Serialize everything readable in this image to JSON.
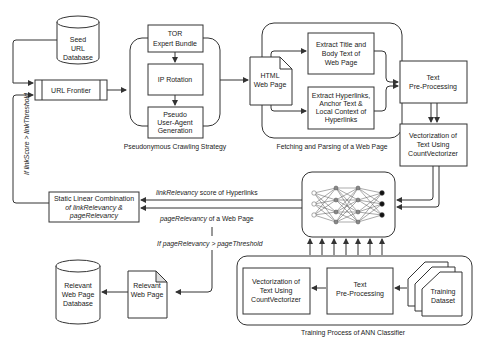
{
  "nodes": {
    "seed_db": [
      "Seed",
      "URL",
      "Database"
    ],
    "url_frontier": "URL Frontier",
    "tor": [
      "TOR",
      "Expert Bundle"
    ],
    "ip_rotation": "IP Rotation",
    "pseudo_ua": [
      "Pseudo",
      "User-Agent",
      "Generation"
    ],
    "html_page": [
      "HTML",
      "Web Page"
    ],
    "extract_title": [
      "Extract Title and",
      "Body Text of",
      "Web Page"
    ],
    "extract_links": [
      "Extract Hyperlinks,",
      "Anchor Text &",
      "Local Context of",
      "Hyperlinks"
    ],
    "text_preproc_top": [
      "Text",
      "Pre-Processing"
    ],
    "vectorization_top": [
      "Vectorization of",
      "Text Using",
      "CountVectorizer"
    ],
    "static_linear": [
      "Static Linear Combination",
      "of linkRelevancy &",
      "pageRelevancy"
    ],
    "relevant_page": [
      "Relevant",
      "Web Page"
    ],
    "relevant_db": [
      "Relevant",
      "Web Page",
      "Database"
    ],
    "vectorization_bottom": [
      "Vectorization of",
      "Text Using",
      "CountVectorizer"
    ],
    "text_preproc_bottom": [
      "Text",
      "Pre-Processing"
    ],
    "training_dataset": [
      "Training",
      "Dataset"
    ]
  },
  "groups": {
    "pseudonymous": "Pseudonymous Crawling Strategy",
    "fetching": "Fetching and Parsing of a Web Page",
    "training": "Training Process of ANN Classifier"
  },
  "edges": {
    "link_relevancy": [
      "linkRelevancy",
      " score of Hyperlinks"
    ],
    "page_relevancy": [
      "pageRelevancy",
      " of a Web Page"
    ],
    "page_threshold": "If pageRelevancy > pageThreshold",
    "link_threshold": "If linkScore > linkThreshold"
  }
}
